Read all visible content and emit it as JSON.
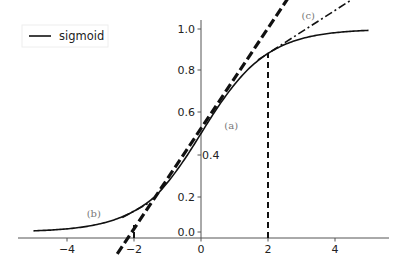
{
  "chart_data": {
    "type": "line",
    "title": "",
    "xlabel": "",
    "ylabel": "",
    "xlim": [
      -5.5,
      5.8
    ],
    "ylim": [
      -0.03,
      1.05
    ],
    "grid": false,
    "legend": {
      "placement": "top-left",
      "entries": [
        "sigmoid"
      ]
    },
    "x_ticks": [
      -4,
      -2,
      0,
      2,
      4
    ],
    "x_tick_labels": [
      "−4",
      "−2",
      "0",
      "2",
      "4"
    ],
    "y_ticks": [
      0.0,
      0.2,
      0.4,
      0.6,
      0.8,
      1.0
    ],
    "y_tick_labels": [
      "0.0",
      "0.2",
      "0.4",
      "0.6",
      "0.8",
      "1.0"
    ],
    "series": [
      {
        "name": "sigmoid",
        "function": "1/(1+exp(-x))",
        "x_range": [
          -5,
          5
        ],
        "x": [
          -5,
          -4,
          -3,
          -2,
          -1,
          0,
          1,
          2,
          3,
          4,
          5
        ],
        "y": [
          0.007,
          0.018,
          0.047,
          0.119,
          0.269,
          0.5,
          0.731,
          0.881,
          0.953,
          0.982,
          0.993
        ]
      }
    ],
    "tangents": [
      {
        "label": "(a)",
        "at_x": 0,
        "slope": 0.25,
        "x_range": [
          -2.5,
          2.75
        ],
        "style": "thick-dashed"
      },
      {
        "label": "(b)",
        "at_x": -2,
        "slope": 0.105,
        "x_range": [
          -2.35,
          -1.55
        ],
        "style": "dash-dot"
      },
      {
        "label": "(c)",
        "at_x": 2,
        "slope": 0.105,
        "x_range": [
          1.7,
          4.5
        ],
        "style": "dash-dot"
      }
    ],
    "vertical_guides": [
      {
        "x": 2,
        "from_y": 0,
        "to_y": 0.881,
        "style": "dashed"
      },
      {
        "x": -2,
        "from_y": 0.0,
        "to_y": 0.04,
        "style": "dashed"
      }
    ],
    "annotations": [
      {
        "text": "(a)",
        "x": 0.9,
        "y": 0.52
      },
      {
        "text": "(b)",
        "x": -3.2,
        "y": 0.085
      },
      {
        "text": "(c)",
        "x": 3.2,
        "y": 1.05
      }
    ]
  }
}
